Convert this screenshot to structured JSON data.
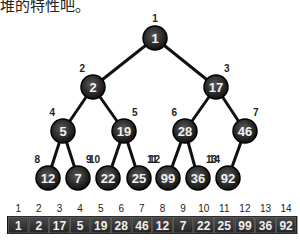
{
  "caption": "堆的特性吧。",
  "tree": {
    "nodes": [
      {
        "index": "1",
        "value": "1",
        "x": 155,
        "y": 38
      },
      {
        "index": "2",
        "value": "2",
        "x": 93,
        "y": 87
      },
      {
        "index": "3",
        "value": "17",
        "x": 216,
        "y": 87
      },
      {
        "index": "4",
        "value": "5",
        "x": 63,
        "y": 131
      },
      {
        "index": "5",
        "value": "19",
        "x": 124,
        "y": 131
      },
      {
        "index": "6",
        "value": "28",
        "x": 185,
        "y": 131
      },
      {
        "index": "7",
        "value": "46",
        "x": 245,
        "y": 131
      },
      {
        "index": "8",
        "value": "12",
        "x": 48,
        "y": 178
      },
      {
        "index": "9",
        "value": "7",
        "x": 78,
        "y": 178
      },
      {
        "index": "10",
        "value": "22",
        "x": 108,
        "y": 178
      },
      {
        "index": "11",
        "value": "25",
        "x": 139,
        "y": 178
      },
      {
        "index": "12",
        "value": "99",
        "x": 168,
        "y": 178
      },
      {
        "index": "13",
        "value": "36",
        "x": 198,
        "y": 178
      },
      {
        "index": "14",
        "value": "92",
        "x": 228,
        "y": 178
      }
    ],
    "edges": [
      [
        1,
        2
      ],
      [
        1,
        3
      ],
      [
        2,
        4
      ],
      [
        2,
        5
      ],
      [
        3,
        6
      ],
      [
        3,
        7
      ],
      [
        4,
        8
      ],
      [
        4,
        9
      ],
      [
        5,
        10
      ],
      [
        5,
        11
      ],
      [
        6,
        12
      ],
      [
        6,
        13
      ],
      [
        7,
        14
      ]
    ],
    "node_color": "#2b2b2b"
  },
  "array": {
    "indices": [
      "1",
      "2",
      "3",
      "4",
      "5",
      "6",
      "7",
      "8",
      "9",
      "10",
      "11",
      "12",
      "13",
      "14"
    ],
    "values": [
      "1",
      "2",
      "17",
      "5",
      "19",
      "28",
      "46",
      "12",
      "7",
      "22",
      "25",
      "99",
      "36",
      "92"
    ],
    "cell_color": "#333333"
  }
}
